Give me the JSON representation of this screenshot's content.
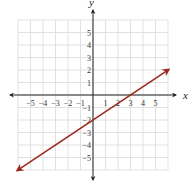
{
  "chart_data": {
    "type": "line",
    "title": "",
    "xlabel": "x",
    "ylabel": "y",
    "xlim": [
      -6,
      6
    ],
    "ylim": [
      -6,
      6
    ],
    "grid": true,
    "x_ticks": [
      -5,
      -4,
      -3,
      -2,
      -1,
      1,
      2,
      3,
      4,
      5
    ],
    "y_ticks": [
      5,
      4,
      3,
      2,
      1,
      -1,
      -2,
      -3,
      -4,
      -5
    ],
    "x_tick_labels": [
      "−5",
      "−4",
      "−3",
      "−2",
      "−1",
      "1",
      "2",
      "3",
      "4",
      "5"
    ],
    "y_tick_labels": [
      "5",
      "4",
      "3",
      "2",
      "1",
      "−1",
      "−2",
      "−3",
      "−4",
      "−5"
    ],
    "series": [
      {
        "name": "line",
        "color": "#9b2a1e",
        "equation": "y = (2/3)x - 2",
        "slope": 0.6667,
        "y_intercept": -2,
        "x_intercept": 3,
        "x": [
          -6,
          0,
          3,
          6
        ],
        "y": [
          -6,
          -2,
          0,
          2
        ],
        "arrows_both_ends": true
      }
    ]
  },
  "colors": {
    "axis": "#222222",
    "grid": "#d9d9d9",
    "line": "#9b2a1e"
  }
}
